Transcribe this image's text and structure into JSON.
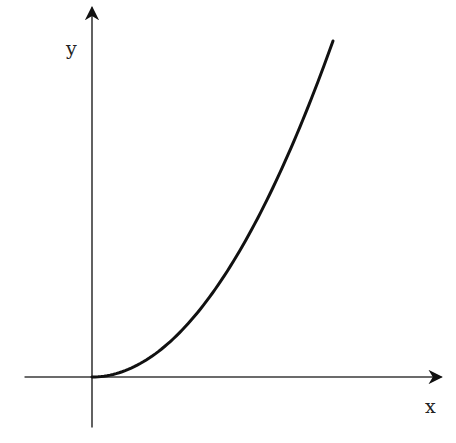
{
  "chart_data": {
    "type": "line",
    "title": "",
    "xlabel": "x",
    "ylabel": "y",
    "function": "y = x^2",
    "x_range": [
      0,
      1
    ],
    "y_range": [
      0,
      1
    ],
    "xlim": [
      -0.28,
      1.45
    ],
    "ylim": [
      -0.15,
      1.1
    ],
    "grid": false,
    "legend": "none",
    "series": [
      {
        "name": "curve",
        "x": [
          0,
          0.1,
          0.2,
          0.3,
          0.4,
          0.5,
          0.6,
          0.7,
          0.8,
          0.9,
          1.0
        ],
        "y": [
          0,
          0.01,
          0.04,
          0.09,
          0.16,
          0.25,
          0.36,
          0.49,
          0.64,
          0.81,
          1.0
        ]
      }
    ],
    "colors": {
      "axes": "#3a3a3a",
      "curve": "#111111",
      "background": "#ffffff"
    }
  }
}
